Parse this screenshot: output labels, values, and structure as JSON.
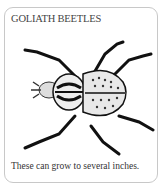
{
  "card": {
    "title": "GOLIATH BEETLES",
    "image": {
      "icon": "goliath-beetle-illustration"
    },
    "caption": "These can grow to several inches."
  }
}
